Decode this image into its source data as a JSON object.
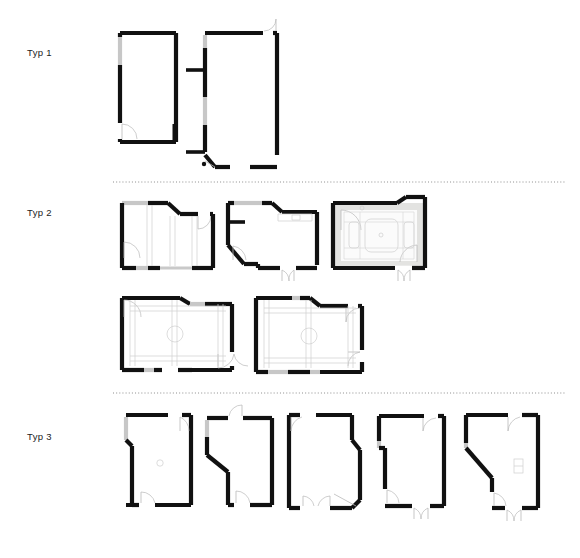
{
  "sheet": {
    "title": "Wohnungstypen Grundrisse",
    "background_color": "#ffffff",
    "wall_color": "#111111",
    "glazing_color": "#c7c7c7",
    "furniture_color": "#cfcfcf",
    "divider_color": "#8d8d8d",
    "width": 580,
    "height": 558
  },
  "labels": {
    "typ1": "Typ 1",
    "typ2": "Typ 2",
    "typ3": "Typ 3"
  },
  "dividers": [
    {
      "name": "divider-typ1-typ2",
      "y": 182,
      "x_start": 113,
      "x_end": 565
    },
    {
      "name": "divider-typ2-typ3",
      "y": 393,
      "x_start": 113,
      "x_end": 565
    }
  ],
  "groups": [
    {
      "label": "Typ 1",
      "label_position": {
        "x": 27,
        "y": 47
      },
      "plan_count": 2,
      "plans": [
        {
          "name": "typ1-plan-1",
          "shape": "rectangle",
          "doors": 1,
          "glazing_walls": 1,
          "furniture": "none"
        },
        {
          "name": "typ1-plan-2",
          "shape": "rectangle-with-stubs",
          "doors": 2,
          "glazing_walls": 2,
          "furniture": "none"
        }
      ]
    },
    {
      "label": "Typ 2",
      "label_position": {
        "x": 27,
        "y": 207
      },
      "plan_count": 5,
      "rows": 2,
      "plans": [
        {
          "name": "typ2-plan-1",
          "shape": "angled-corner",
          "doors": 2,
          "glazing_walls": 2,
          "furniture": "partition-grid"
        },
        {
          "name": "typ2-plan-2",
          "shape": "angled-corner",
          "doors": 2,
          "glazing_walls": 2,
          "furniture": "counter"
        },
        {
          "name": "typ2-plan-3",
          "shape": "angled-corner",
          "doors": 2,
          "glazing_walls": 1,
          "furniture": "table-and-seating",
          "fill": "grey"
        },
        {
          "name": "typ2-plan-4",
          "shape": "angled-corner",
          "doors": 3,
          "glazing_walls": 2,
          "furniture": "ceiling-grid-with-column"
        },
        {
          "name": "typ2-plan-5",
          "shape": "angled-corner",
          "doors": 3,
          "glazing_walls": 2,
          "furniture": "ceiling-grid-with-column"
        }
      ]
    },
    {
      "label": "Typ 3",
      "label_position": {
        "x": 27,
        "y": 431
      },
      "plan_count": 5,
      "plans": [
        {
          "name": "typ3-plan-1",
          "shape": "notched-left",
          "doors": 2,
          "glazing_walls": 2,
          "furniture": "column"
        },
        {
          "name": "typ3-plan-2",
          "shape": "diagonal-left",
          "doors": 2,
          "glazing_walls": 2,
          "furniture": "none"
        },
        {
          "name": "typ3-plan-3",
          "shape": "diagonal-right",
          "doors": 3,
          "glazing_walls": 2,
          "furniture": "none"
        },
        {
          "name": "typ3-plan-4",
          "shape": "notched-left",
          "doors": 2,
          "glazing_walls": 2,
          "furniture": "none"
        },
        {
          "name": "typ3-plan-5",
          "shape": "diagonal-left-large",
          "doors": 2,
          "glazing_walls": 2,
          "furniture": "small-fixture"
        }
      ]
    }
  ]
}
